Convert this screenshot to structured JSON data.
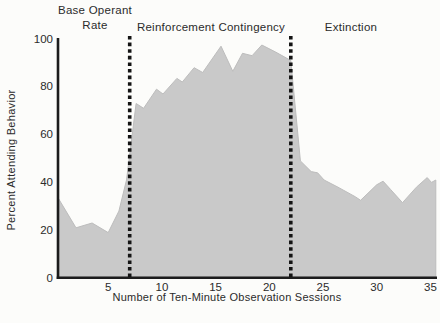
{
  "figure": {
    "y_axis_title": "Percent Attending Behavior",
    "x_axis_title": "Number of Ten-Minute Observation Sessions",
    "phases": [
      {
        "label": "Base Operant Rate",
        "label_lines": [
          "Base Operant",
          "Rate"
        ],
        "start_session": 0,
        "end_session": 7
      },
      {
        "label": "Reinforcement Contingency",
        "start_session": 7,
        "end_session": 22
      },
      {
        "label": "Extinction",
        "start_session": 22,
        "end_session": 35
      }
    ],
    "boundary_sessions": [
      7,
      22
    ],
    "x_ticks": [
      5,
      10,
      15,
      20,
      25,
      30,
      35
    ],
    "y_ticks": [
      0,
      20,
      40,
      60,
      80,
      100
    ]
  },
  "chart_data": {
    "type": "area",
    "title": "",
    "xlabel": "Number of Ten-Minute Observation Sessions",
    "ylabel": "Percent Attending Behavior",
    "xlim": [
      0,
      35.5
    ],
    "ylim": [
      0,
      100
    ],
    "grid": false,
    "legend": "none",
    "annotations": [
      "Base Operant Rate",
      "Reinforcement Contingency",
      "Extinction"
    ],
    "phase_boundaries_x": [
      7,
      22
    ],
    "points": [
      [
        0.4,
        33
      ],
      [
        2,
        21
      ],
      [
        3.5,
        23
      ],
      [
        5,
        19
      ],
      [
        6,
        28
      ],
      [
        6.7,
        41
      ],
      [
        7.6,
        73
      ],
      [
        8.3,
        71
      ],
      [
        9.5,
        79
      ],
      [
        10.1,
        77
      ],
      [
        11.4,
        83.5
      ],
      [
        11.9,
        82
      ],
      [
        13,
        88
      ],
      [
        13.8,
        86
      ],
      [
        15.5,
        97
      ],
      [
        16.6,
        86.5
      ],
      [
        17.5,
        94
      ],
      [
        18.4,
        93
      ],
      [
        19.3,
        97.5
      ],
      [
        20.6,
        94.5
      ],
      [
        22,
        91
      ],
      [
        22.9,
        49
      ],
      [
        23.9,
        44.5
      ],
      [
        24.5,
        44
      ],
      [
        25.1,
        41
      ],
      [
        26.4,
        38
      ],
      [
        28,
        34
      ],
      [
        28.5,
        32.5
      ],
      [
        30,
        39
      ],
      [
        30.6,
        40.5
      ],
      [
        31.3,
        37
      ],
      [
        32.4,
        31.5
      ],
      [
        33.7,
        38
      ],
      [
        34.7,
        42
      ],
      [
        35.1,
        40
      ],
      [
        35.5,
        41
      ]
    ]
  },
  "colors": {
    "area_fill": "#c9c9c9",
    "area_edge": "#bdbdbd",
    "axis": "#1c1c1c",
    "dashed_line": "#141414",
    "text": "#2b2b2b",
    "background": "#fcfcfa"
  }
}
